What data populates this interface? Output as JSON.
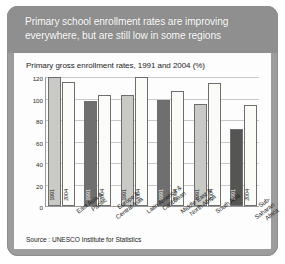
{
  "banner": {
    "title": "Primary school enrollment rates are improving\neverywhere, but are still low in some regions"
  },
  "source": {
    "text": "Source : UNESCO Institute for Statistics"
  },
  "colors": {
    "frame": "#9d9d9d",
    "banner": "#8f8f8f",
    "card": "#fdfdfd",
    "bar_1991_dark": "#6f6f6f",
    "bar_1991_light": "#c9c9c6",
    "bar_2004_light": "#fbfbf8",
    "bar_border": "#6e6e6e",
    "gridline": "#c9c9c9",
    "axis": "#9a9a9a"
  },
  "chart_data": {
    "type": "bar",
    "title": "Primary gross enrollment rates, 1991 and 2004 (%)",
    "xlabel": "",
    "ylabel": "",
    "ylim": [
      0,
      120
    ],
    "yticks": [
      0,
      20,
      40,
      60,
      80,
      100,
      120
    ],
    "grid": true,
    "legend": "none",
    "bar_inner_labels": [
      "1991",
      "2004"
    ],
    "categories": [
      "East Asia &\nPacific",
      "Europe &\nCentral Asia",
      "Latin America &\nCaribbean",
      "Middle East &\nNorth Africa",
      "South Asia",
      "Sub-Saharan\nAfrica"
    ],
    "series": [
      {
        "name": "1991",
        "values": [
          120,
          98,
          103,
          99,
          95,
          72
        ]
      },
      {
        "name": "2004",
        "values": [
          115,
          103,
          120,
          107,
          114,
          94
        ]
      }
    ]
  }
}
